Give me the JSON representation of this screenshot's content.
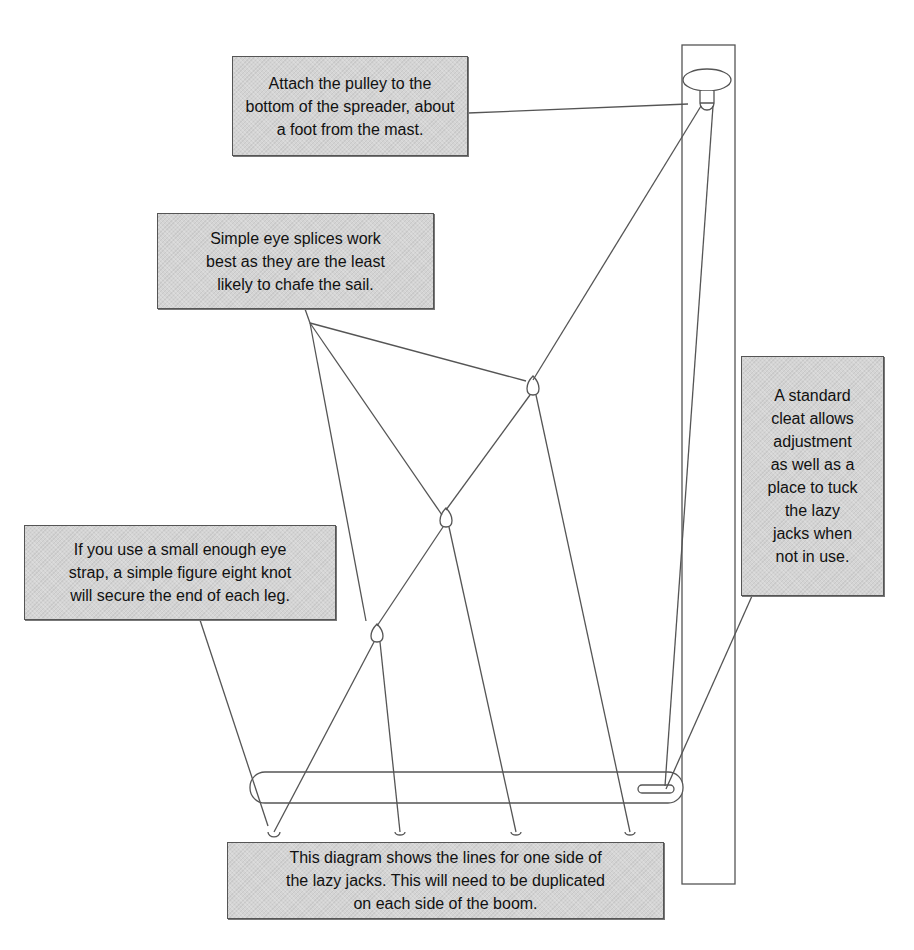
{
  "diagram": {
    "colors": {
      "line": "#555555",
      "callout_fill": "#d4d4d4",
      "callout_border": "#555555",
      "background": "#ffffff"
    },
    "callouts": {
      "pulley": [
        "Attach the pulley to the",
        "bottom of the spreader, about",
        "a foot from the mast."
      ],
      "eye_splices": [
        "Simple eye splices work",
        "best as they are the least",
        "likely to chafe the sail."
      ],
      "cleat": [
        "A standard",
        "cleat allows",
        "adjustment",
        "as well as a",
        "place to tuck",
        "the lazy",
        "jacks when",
        "not in use."
      ],
      "knot": [
        "If you use a small enough eye",
        "strap, a simple figure eight knot",
        "will secure the end of each leg."
      ],
      "overview": [
        "This diagram shows the lines for one side of",
        "the lazy jacks. This will need to be duplicated",
        "on each side of the boom."
      ]
    },
    "components": [
      "mast",
      "spreader",
      "pulley",
      "boom",
      "cleat",
      "eye-splice-1",
      "eye-splice-2",
      "eye-splice-3",
      "eye-strap-1",
      "eye-strap-2",
      "eye-strap-3",
      "eye-strap-4",
      "eye-strap-5"
    ]
  }
}
